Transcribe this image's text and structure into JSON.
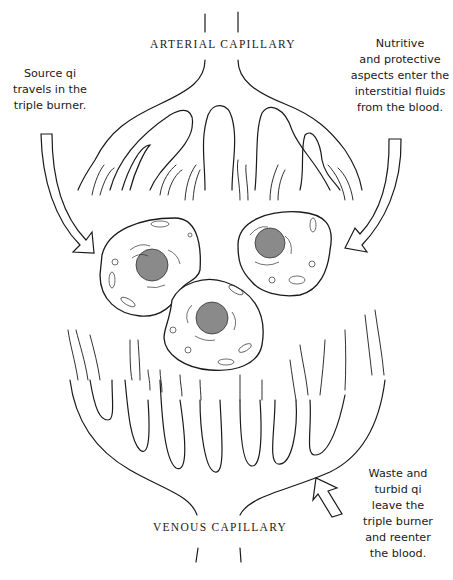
{
  "diagram": {
    "labels": {
      "arterial": "ARTERIAL CAPILLARY",
      "venous": "VENOUS CAPILLARY"
    },
    "notes": {
      "source_qi": "Source qi\ntravels in the\ntriple burner.",
      "nutritive": "Nutritive\nand protective\naspects enter the\ninterstitial fluids\nfrom the blood.",
      "waste": "Waste and\nturbid qi\nleave the\ntriple burner\nand reenter\nthe blood."
    },
    "elements": {
      "cells": 3,
      "arrows": [
        {
          "name": "source-qi-arrow",
          "direction": "down-right"
        },
        {
          "name": "nutritive-arrow",
          "direction": "down-left"
        },
        {
          "name": "waste-arrow",
          "direction": "up-left"
        }
      ]
    },
    "colors": {
      "line": "#1a1a1a",
      "background": "#ffffff",
      "nucleus": "#8a8a8a"
    }
  }
}
